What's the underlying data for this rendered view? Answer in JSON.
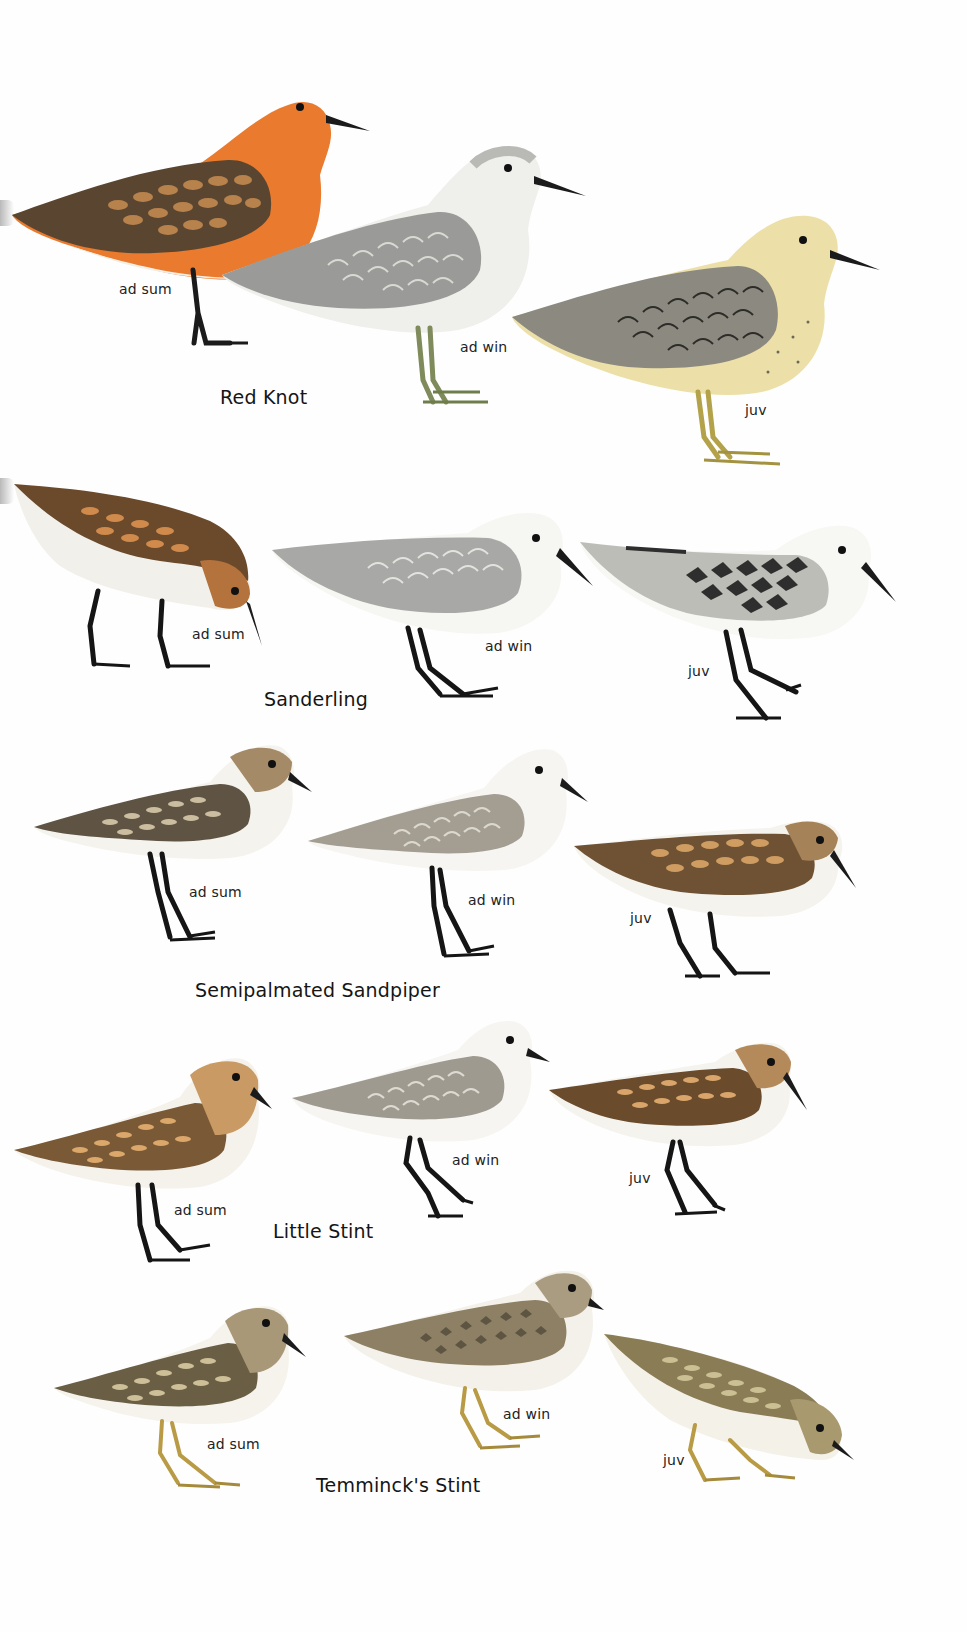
{
  "plate": {
    "rows": [
      {
        "species": "Red Knot",
        "birds": [
          {
            "age": "ad sum",
            "colors": {
              "back": "#5a4630",
              "belly": "#e97a2e",
              "under": "#f3efe6",
              "head": "#e8873a",
              "legs": "#1b1b1b",
              "scale": "#c98d52"
            }
          },
          {
            "age": "ad win",
            "colors": {
              "back": "#9a9a98",
              "belly": "#efefec",
              "under": "#f6f6f3",
              "head": "#b9b9b5",
              "legs": "#7f8b5a",
              "scale": "#d9d9d4"
            }
          },
          {
            "age": "juv",
            "colors": {
              "back": "#8c8a80",
              "belly": "#ece0a8",
              "under": "#f1ecd4",
              "head": "#b8b3a0",
              "legs": "#b3a24a",
              "scale": "#d8d4c4"
            }
          }
        ]
      },
      {
        "species": "Sanderling",
        "birds": [
          {
            "age": "ad sum",
            "colors": {
              "back": "#6b4a2b",
              "belly": "#f2f0ea",
              "under": "#f6f5f1",
              "head": "#b4723c",
              "legs": "#151515",
              "scale": "#d08a4c"
            }
          },
          {
            "age": "ad win",
            "colors": {
              "back": "#a8a8a6",
              "belly": "#f6f6f2",
              "under": "#fbfbf8",
              "head": "#cfcfcb",
              "legs": "#151515",
              "scale": "#e2e2de"
            }
          },
          {
            "age": "juv",
            "colors": {
              "back": "#2e2e2e",
              "belly": "#f7f7f4",
              "under": "#fbfbf8",
              "head": "#bdbdb8",
              "legs": "#151515",
              "scale": "#e0e0dc"
            }
          }
        ]
      },
      {
        "species": "Semipalmated Sandpiper",
        "birds": [
          {
            "age": "ad sum",
            "colors": {
              "back": "#5f5443",
              "belly": "#f5f3ee",
              "under": "#fbfaf7",
              "head": "#a48a66",
              "legs": "#151515",
              "scale": "#cbbd9f"
            }
          },
          {
            "age": "ad win",
            "colors": {
              "back": "#a39d92",
              "belly": "#f6f5f1",
              "under": "#fbfbf8",
              "head": "#c6c1b6",
              "legs": "#151515",
              "scale": "#dcd8ce"
            }
          },
          {
            "age": "juv",
            "colors": {
              "back": "#6e5233",
              "belly": "#f5f3ee",
              "under": "#fbfaf7",
              "head": "#a58258",
              "legs": "#151515",
              "scale": "#cf9c62"
            }
          }
        ]
      },
      {
        "species": "Little Stint",
        "birds": [
          {
            "age": "ad sum",
            "colors": {
              "back": "#7a5a36",
              "belly": "#f5f2ec",
              "under": "#fbfaf7",
              "head": "#c99a63",
              "legs": "#151515",
              "scale": "#dba76a"
            }
          },
          {
            "age": "ad win",
            "colors": {
              "back": "#9f9a90",
              "belly": "#f6f5f1",
              "under": "#fbfbf8",
              "head": "#cac6bc",
              "legs": "#151515",
              "scale": "#dedad2"
            }
          },
          {
            "age": "juv",
            "colors": {
              "back": "#6a4b2c",
              "belly": "#f5f3ee",
              "under": "#fbfaf7",
              "head": "#b58a5a",
              "legs": "#151515",
              "scale": "#d9a56a"
            }
          }
        ]
      },
      {
        "species": "Temminck's Stint",
        "birds": [
          {
            "age": "ad sum",
            "colors": {
              "back": "#6a5e44",
              "belly": "#f5f3ec",
              "under": "#fbfaf6",
              "head": "#a99877",
              "legs": "#b99a45",
              "scale": "#cdbf98"
            }
          },
          {
            "age": "ad win",
            "colors": {
              "back": "#8d8064",
              "belly": "#f4f1ea",
              "under": "#fbfaf6",
              "head": "#a99c80",
              "legs": "#b99a45",
              "scale": "#c9bc9c"
            }
          },
          {
            "age": "juv",
            "colors": {
              "back": "#8a7c55",
              "belly": "#f4f1e8",
              "under": "#fbfaf5",
              "head": "#a8996e",
              "legs": "#b99a45",
              "scale": "#cbbf94"
            }
          }
        ]
      }
    ]
  }
}
